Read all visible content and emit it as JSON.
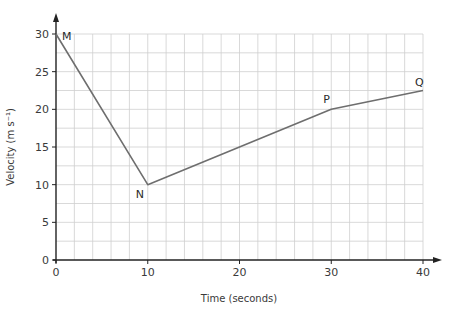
{
  "chart_data": {
    "type": "line",
    "title": "",
    "xlabel": "Time (seconds)",
    "ylabel": "Velocity (m s⁻¹)",
    "xlim": [
      0,
      40
    ],
    "ylim": [
      0,
      30
    ],
    "grid": true,
    "grid_x_step": 2,
    "grid_y_step": 2.5,
    "x_ticks": [
      0,
      10,
      20,
      30,
      40
    ],
    "y_ticks": [
      0,
      5,
      10,
      15,
      20,
      25,
      30
    ],
    "legend": null,
    "series": [
      {
        "name": "velocity",
        "x": [
          0,
          10,
          30,
          40
        ],
        "y": [
          30,
          10,
          20,
          22.5
        ],
        "point_labels": [
          "M",
          "N",
          "P",
          "Q"
        ]
      }
    ],
    "colors": {
      "line": "#6e6e6e",
      "grid": "#cfcfcf",
      "axis": "#222222"
    }
  }
}
